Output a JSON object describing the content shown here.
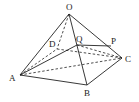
{
  "diagram": {
    "type": "pyramid",
    "labels": {
      "O": "O",
      "A": "A",
      "B": "B",
      "C": "C",
      "D": "D",
      "P": "P",
      "Q": "Q"
    },
    "points": {
      "O": [
        69,
        14
      ],
      "A": [
        20,
        75
      ],
      "B": [
        87,
        85
      ],
      "C": [
        122,
        58
      ],
      "D": [
        57,
        49
      ],
      "Q": [
        77,
        45
      ],
      "P": [
        111,
        46
      ]
    },
    "solid_edges": [
      [
        "O",
        "A"
      ],
      [
        "O",
        "B"
      ],
      [
        "O",
        "C"
      ],
      [
        "A",
        "B"
      ],
      [
        "B",
        "C"
      ],
      [
        "A",
        "Q"
      ],
      [
        "Q",
        "P"
      ]
    ],
    "dashed_edges": [
      [
        "O",
        "D"
      ],
      [
        "A",
        "D"
      ],
      [
        "D",
        "C"
      ],
      [
        "A",
        "C"
      ],
      [
        "Q",
        "C"
      ]
    ]
  }
}
